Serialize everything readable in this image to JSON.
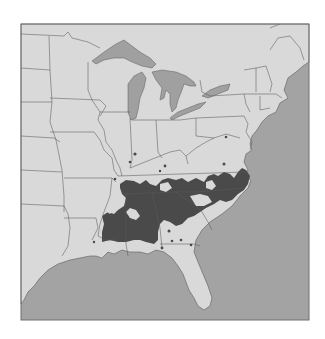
{
  "map": {
    "title": "",
    "region": "Eastern United States",
    "description": "Species distribution range map",
    "colors": {
      "background": "#ffffff",
      "land": "#d9d9d9",
      "water": "#a3a3a3",
      "lakes": "#a0a0a0",
      "range": "#4a4a4a",
      "borders": "#5a5a5a",
      "frame": "#6e6e6e"
    },
    "layers": [
      {
        "name": "ocean",
        "label": "Atlantic Ocean / Gulf of Mexico"
      },
      {
        "name": "land",
        "label": "States"
      },
      {
        "name": "great-lakes",
        "label": "Great Lakes"
      },
      {
        "name": "distribution-range",
        "label": "Range (shaded)"
      },
      {
        "name": "occurrence-points",
        "label": "Isolated occurrences"
      }
    ],
    "occurrence_points_count": 14
  }
}
